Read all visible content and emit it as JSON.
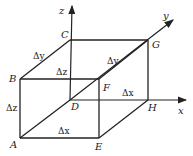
{
  "diagram": {
    "type": "3d-box-in-axes",
    "axes": {
      "x": {
        "label": "x"
      },
      "y": {
        "label": "y"
      },
      "z": {
        "label": "z"
      }
    },
    "vertices": {
      "A": "A",
      "B": "B",
      "C": "C",
      "D": "D",
      "E": "E",
      "F": "F",
      "G": "G",
      "H": "H"
    },
    "edge_labels": {
      "dy_left": "Δy",
      "dz_center": "Δz",
      "dy_right": "Δy",
      "dz_left": "Δz",
      "dx_right": "Δx",
      "dx_bottom": "Δx"
    },
    "colors": {
      "line": "#222222",
      "background": "#ffffff"
    }
  }
}
